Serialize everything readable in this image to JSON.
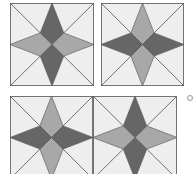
{
  "colors": {
    "background": "#ffffff",
    "tile_fill": "#eeeeee",
    "dark": "#666666",
    "medium": "#a8a8a8",
    "line": "#5a5a5a"
  },
  "tiles": [
    {
      "id": "top-left",
      "x": 10,
      "y": 3,
      "w": 84,
      "h": 83,
      "vertical": "dark",
      "horizontal": "medium"
    },
    {
      "id": "top-right",
      "x": 101,
      "y": 3,
      "w": 83,
      "h": 83,
      "vertical": "medium",
      "horizontal": "dark"
    },
    {
      "id": "bottom-left",
      "x": 10,
      "y": 96,
      "w": 83,
      "h": 83,
      "vertical": "medium",
      "horizontal": "dark"
    },
    {
      "id": "bottom-right",
      "x": 93,
      "y": 96,
      "w": 84,
      "h": 83,
      "vertical": "dark",
      "horizontal": "medium"
    }
  ],
  "marker": {
    "x": 187,
    "y": 95
  }
}
